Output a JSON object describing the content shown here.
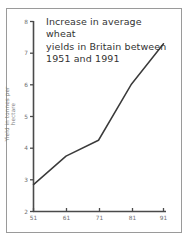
{
  "chart_data": {
    "type": "line",
    "title": "Increase in average wheat\nyields in Britain between\n1951 and 1991",
    "xlabel": "",
    "ylabel": "Yield in tonnes per hectare",
    "categories": [
      "51",
      "61",
      "71",
      "81",
      "91"
    ],
    "x": [
      1951,
      1961,
      1971,
      1981,
      1991
    ],
    "values": [
      2.85,
      3.75,
      4.25,
      6.0,
      7.3
    ],
    "series": [
      {
        "name": "Average wheat yield",
        "values": [
          2.85,
          3.75,
          4.25,
          6.0,
          7.3
        ]
      }
    ],
    "ylim": [
      2,
      8
    ],
    "yticks": [
      2,
      3,
      4,
      5,
      6,
      7,
      8
    ],
    "ytick_labels": [
      "2",
      "3",
      "4",
      "5",
      "6",
      "7",
      "8"
    ],
    "xtick_labels": [
      "51",
      "61",
      "71",
      "81",
      "91"
    ],
    "grid": false,
    "legend": false,
    "legend_position": "none",
    "line_color": "#3a3a3a",
    "axis_color": "#4a4a4a",
    "frame_color": "#9a9a9a",
    "text_color": "#333333",
    "tick_text_color": "#6e6e6e"
  }
}
